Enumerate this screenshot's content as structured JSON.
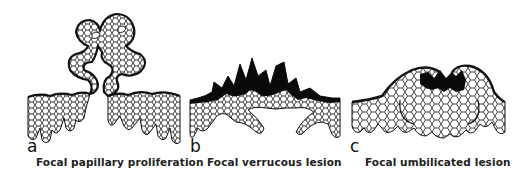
{
  "figure": {
    "panels": [
      {
        "letter": "a",
        "caption": "Focal papillary proliferation"
      },
      {
        "letter": "b",
        "caption": "Focal verrucous lesion"
      },
      {
        "letter": "c",
        "caption": "Focal umbilicated lesion"
      }
    ],
    "colors": {
      "ink": "#111111",
      "background": "#ffffff",
      "keratin": "#0a0a0a"
    }
  }
}
